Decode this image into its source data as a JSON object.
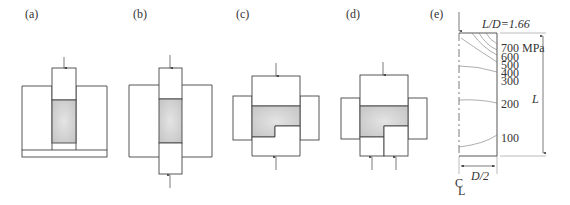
{
  "figure": {
    "panels": [
      {
        "id": "a",
        "label": "(a)",
        "description": "Single-action die compaction: upper punch only, fixed bottom"
      },
      {
        "id": "b",
        "label": "(b)",
        "description": "Double-action compaction: upper and lower punches"
      },
      {
        "id": "c",
        "label": "(c)",
        "description": "Stepped part compaction with single lower punch"
      },
      {
        "id": "d",
        "label": "(d)",
        "description": "Stepped part compaction with split lower punches"
      },
      {
        "id": "e",
        "label": "(e)",
        "description": "Density/pressure contours in compact"
      }
    ],
    "panel_e": {
      "ratio_label": "L/D=1.66",
      "contour_labels": [
        "700 MPa",
        "600",
        "500",
        "400",
        "300",
        "200",
        "100"
      ],
      "height_label": "L",
      "width_label": "D/2",
      "centerline_label": "C̲L"
    }
  },
  "colors": {
    "stroke": "#444444",
    "powder_fill": "#d2d2d2",
    "contour": "#777777"
  }
}
